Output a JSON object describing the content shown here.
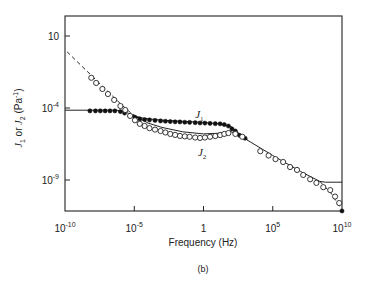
{
  "chart_data": {
    "type": "scatter",
    "title": "",
    "caption": "(b)",
    "xlabel": "Frequency (Hz)",
    "ylabel": "J1 or J2 (Pa^-1)",
    "xscale": "log",
    "yscale": "log",
    "xlim_log10": [
      -10,
      10
    ],
    "ylim_log10": [
      -11.2,
      2.4
    ],
    "x_ticks": [
      {
        "log10": -10,
        "base": "10",
        "exp": "-10"
      },
      {
        "log10": -5,
        "base": "10",
        "exp": "-5"
      },
      {
        "log10": 0,
        "base": "1",
        "exp": ""
      },
      {
        "log10": 5,
        "base": "10",
        "exp": "5"
      },
      {
        "log10": 10,
        "base": "10",
        "exp": "10"
      }
    ],
    "y_ticks": [
      {
        "log10": 1,
        "base": "10",
        "exp": ""
      },
      {
        "log10": -4,
        "base": "10",
        "exp": "-4"
      },
      {
        "log10": -9,
        "base": "10",
        "exp": "-9"
      }
    ],
    "grid": false,
    "legend": "inline labels",
    "annotations": [
      {
        "text": "J",
        "sub": "1",
        "x_log10": -0.6,
        "y_log10": -4.7
      },
      {
        "text": "J",
        "sub": "2",
        "x_log10": -0.4,
        "y_log10": -7.3
      }
    ],
    "series": [
      {
        "name": "J1 (filled circles)",
        "marker": "filled-circle",
        "points_log10": [
          [
            -8.2,
            -4.2
          ],
          [
            -7.8,
            -4.2
          ],
          [
            -7.45,
            -4.2
          ],
          [
            -7.1,
            -4.2
          ],
          [
            -6.75,
            -4.2
          ],
          [
            -6.4,
            -4.2
          ],
          [
            -6.0,
            -4.25
          ],
          [
            -5.7,
            -4.35
          ],
          [
            -5.3,
            -4.55
          ],
          [
            -4.95,
            -4.65
          ],
          [
            -4.6,
            -4.76
          ],
          [
            -4.25,
            -4.8
          ],
          [
            -3.9,
            -4.83
          ],
          [
            -3.5,
            -4.86
          ],
          [
            -3.1,
            -4.9
          ],
          [
            -2.75,
            -4.92
          ],
          [
            -2.4,
            -4.94
          ],
          [
            -2.05,
            -4.96
          ],
          [
            -1.7,
            -4.97
          ],
          [
            -1.35,
            -4.99
          ],
          [
            -1.0,
            -5.0
          ],
          [
            -0.6,
            -5.02
          ],
          [
            -0.25,
            -5.04
          ],
          [
            0.1,
            -5.05
          ],
          [
            0.47,
            -5.07
          ],
          [
            0.85,
            -5.09
          ],
          [
            1.2,
            -5.1
          ],
          [
            1.5,
            -5.15
          ],
          [
            1.8,
            -5.25
          ],
          [
            2.05,
            -5.45
          ],
          [
            2.3,
            -5.6
          ],
          [
            2.6,
            -5.9
          ],
          [
            3.0,
            -6.1
          ],
          [
            10.0,
            -11.2
          ]
        ]
      },
      {
        "name": "J2 (open circles)",
        "marker": "open-circle",
        "points_log10": [
          [
            -8.1,
            -1.9
          ],
          [
            -7.75,
            -2.26
          ],
          [
            -7.3,
            -2.68
          ],
          [
            -6.9,
            -3.03
          ],
          [
            -6.45,
            -3.44
          ],
          [
            -6.0,
            -3.86
          ],
          [
            -5.65,
            -4.14
          ],
          [
            -5.3,
            -4.55
          ],
          [
            -4.95,
            -4.85
          ],
          [
            -4.6,
            -5.1
          ],
          [
            -4.25,
            -5.25
          ],
          [
            -3.9,
            -5.4
          ],
          [
            -3.5,
            -5.5
          ],
          [
            -3.1,
            -5.6
          ],
          [
            -2.75,
            -5.7
          ],
          [
            -2.4,
            -5.8
          ],
          [
            -2.05,
            -5.87
          ],
          [
            -1.7,
            -5.94
          ],
          [
            -1.35,
            -5.97
          ],
          [
            -1.0,
            -6.0
          ],
          [
            -0.6,
            -6.05
          ],
          [
            -0.25,
            -6.08
          ],
          [
            0.1,
            -6.05
          ],
          [
            0.47,
            -6.0
          ],
          [
            0.85,
            -5.95
          ],
          [
            1.2,
            -5.88
          ],
          [
            1.5,
            -5.8
          ],
          [
            1.8,
            -5.74
          ],
          [
            2.3,
            -5.8
          ],
          [
            2.8,
            -6.0
          ],
          [
            4.1,
            -7.0
          ],
          [
            4.7,
            -7.3
          ],
          [
            5.2,
            -7.55
          ],
          [
            5.75,
            -7.75
          ],
          [
            6.25,
            -8.1
          ],
          [
            6.75,
            -8.3
          ],
          [
            7.2,
            -8.65
          ],
          [
            7.7,
            -8.95
          ],
          [
            8.15,
            -9.2
          ],
          [
            8.65,
            -9.5
          ],
          [
            9.15,
            -9.7
          ],
          [
            9.5,
            -10.15
          ],
          [
            9.8,
            -10.6
          ]
        ]
      },
      {
        "name": "J1 model (solid line)",
        "style": "solid",
        "points_log10": [
          [
            -10,
            -4.15
          ],
          [
            -6.3,
            -4.15
          ],
          [
            -5.7,
            -4.25
          ],
          [
            -5.0,
            -4.55
          ],
          [
            -4.3,
            -4.72
          ],
          [
            -3.0,
            -4.85
          ],
          [
            0,
            -5.0
          ],
          [
            1.2,
            -5.1
          ],
          [
            2.0,
            -5.3
          ],
          [
            2.5,
            -5.7
          ],
          [
            3.2,
            -6.25
          ],
          [
            5.0,
            -7.3
          ],
          [
            7.0,
            -8.4
          ],
          [
            8.4,
            -9.1
          ],
          [
            8.8,
            -9.15
          ],
          [
            10,
            -9.15
          ]
        ]
      },
      {
        "name": "J2 model (dashed line)",
        "style": "dashed",
        "points_log10": [
          [
            -9.85,
            -0.1
          ],
          [
            -6.0,
            -3.7
          ],
          [
            -5.3,
            -4.3
          ],
          [
            -4.6,
            -4.75
          ]
        ]
      },
      {
        "name": "J2 model high-frequency (dashed line)",
        "style": "dashed",
        "points_log10": [
          [
            8.4,
            -9.1
          ],
          [
            9.2,
            -9.9
          ],
          [
            10,
            -11.1
          ]
        ]
      },
      {
        "name": "J2 model mid (solid line)",
        "style": "solid",
        "points_log10": [
          [
            -5.0,
            -4.55
          ],
          [
            -4.0,
            -5.05
          ],
          [
            -3.0,
            -5.35
          ],
          [
            -1.5,
            -5.65
          ],
          [
            0,
            -5.8
          ],
          [
            1.2,
            -5.75
          ],
          [
            2.0,
            -5.65
          ],
          [
            2.6,
            -5.85
          ],
          [
            3.2,
            -6.25
          ]
        ]
      }
    ]
  }
}
